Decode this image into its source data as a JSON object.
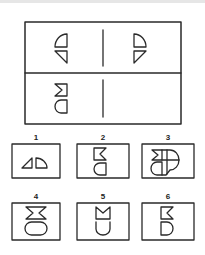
{
  "puzzle": {
    "type": "matrix-completion",
    "grid": {
      "rows": 2,
      "cols": 2,
      "cells": [
        {
          "position": "top-left",
          "shapes": [
            "quarter-circle-curve-up-left",
            "right-triangle-hypotenuse-descending-right"
          ]
        },
        {
          "position": "top-right",
          "shapes": [
            "quarter-circle-curve-up-right",
            "right-triangle-hypotenuse-descending-left"
          ]
        },
        {
          "position": "bottom-left",
          "shapes": [
            "notched-square-notch-left",
            "d-shape-curve-left"
          ]
        },
        {
          "position": "bottom-right",
          "shapes": [],
          "missing": true
        }
      ]
    },
    "options": [
      {
        "label": "1",
        "shapes": [
          "right-triangle",
          "quarter-circle"
        ]
      },
      {
        "label": "2",
        "shapes": [
          "notched-square-notch-right",
          "d-shape-curve-left"
        ]
      },
      {
        "label": "3",
        "shapes": [
          "notched-square",
          "circle-quartered",
          "d-shape"
        ]
      },
      {
        "label": "4",
        "shapes": [
          "hourglass-notched-both-sides",
          "stadium-oval"
        ]
      },
      {
        "label": "5",
        "shapes": [
          "notched-square-notch-top",
          "u-shape-curve-bottom"
        ]
      },
      {
        "label": "6",
        "shapes": [
          "notched-square-notch-right",
          "d-shape-curve-right"
        ]
      }
    ]
  },
  "colors": {
    "stroke": "#2a2a2a",
    "background": "#ffffff"
  }
}
